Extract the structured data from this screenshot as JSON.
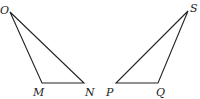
{
  "diagram": {
    "type": "geometry",
    "stroke_color": "#222222",
    "background": "#ffffff",
    "triangles": [
      {
        "name": "OMN",
        "vertices": [
          {
            "label": "O",
            "x": 10,
            "y": 12,
            "label_x": 0,
            "label_y": 14
          },
          {
            "label": "M",
            "x": 42,
            "y": 83,
            "label_x": 33,
            "label_y": 96
          },
          {
            "label": "N",
            "x": 84,
            "y": 83,
            "label_x": 85,
            "label_y": 96
          }
        ]
      },
      {
        "name": "SPQ",
        "vertices": [
          {
            "label": "S",
            "x": 188,
            "y": 11,
            "label_x": 190,
            "label_y": 12
          },
          {
            "label": "P",
            "x": 116,
            "y": 83,
            "label_x": 106,
            "label_y": 96
          },
          {
            "label": "Q",
            "x": 158,
            "y": 83,
            "label_x": 156,
            "label_y": 96
          }
        ]
      }
    ]
  }
}
